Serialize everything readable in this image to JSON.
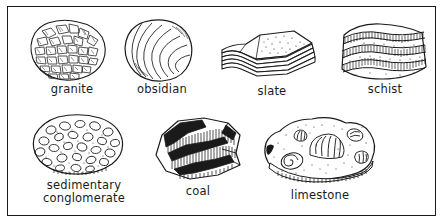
{
  "figure": {
    "ink_color": "#1a1a1a",
    "background_color": "#ffffff",
    "frame": "thin black rectangular border"
  },
  "specimens": [
    {
      "id": "granite",
      "label": "granite",
      "type": "igneous",
      "texture": "coarse interlocking angular crystals, speckled salt-and-pepper",
      "icon": "granite-rock-icon"
    },
    {
      "id": "obsidian",
      "label": "obsidian",
      "type": "igneous",
      "texture": "smooth glassy with concentric conchoidal fracture rings",
      "icon": "obsidian-rock-icon"
    },
    {
      "id": "slate",
      "label": "slate",
      "type": "metamorphic",
      "texture": "flat stacked thin sheets, layered edge",
      "icon": "slate-rock-icon"
    },
    {
      "id": "schist",
      "label": "schist",
      "type": "metamorphic",
      "texture": "wavy foliated bands with hatched shading",
      "icon": "schist-rock-icon"
    },
    {
      "id": "sedimentary-conglomerate",
      "label": "sedimentary\nconglomerate",
      "type": "sedimentary",
      "texture": "rounded pebbles and clasts embedded in fine matrix",
      "icon": "conglomerate-rock-icon"
    },
    {
      "id": "coal",
      "label": "coal",
      "type": "sedimentary",
      "texture": "dark banded layers, heavy black shading, blocky fracture",
      "icon": "coal-rock-icon"
    },
    {
      "id": "limestone",
      "label": "limestone",
      "type": "sedimentary",
      "texture": "stippled matrix containing fossil shells: fan scallop, spiral snail, small shells",
      "icon": "limestone-rock-icon"
    }
  ]
}
